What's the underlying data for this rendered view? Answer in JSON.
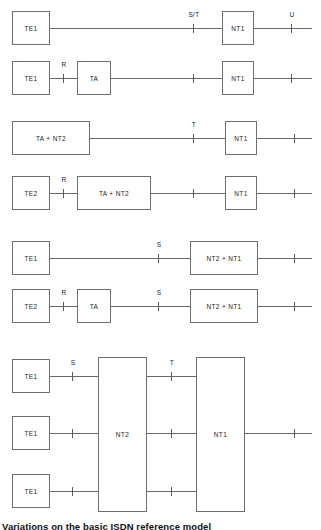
{
  "figure": {
    "caption": "Variations on the basic ISDN reference model",
    "colors": {
      "box_border": "#6e6e6e",
      "wire": "#6a6a6a",
      "tick": "#5a5a5a",
      "text": "#1d1d1d",
      "background": "#ffffff"
    }
  },
  "rows": [
    {
      "id": "row-1",
      "boxes": [
        {
          "label": "TE1"
        },
        {
          "label": "NT1"
        }
      ],
      "interfaces": [
        {
          "label": "S/T"
        },
        {
          "label": "U"
        }
      ]
    },
    {
      "id": "row-2",
      "boxes": [
        {
          "label": "TE1"
        },
        {
          "label": "TA"
        },
        {
          "label": "NT1"
        }
      ],
      "interfaces": [
        {
          "label": "R"
        },
        {
          "label": ""
        },
        {
          "label": ""
        }
      ]
    },
    {
      "id": "row-3",
      "boxes": [
        {
          "label": "TA + NT2"
        },
        {
          "label": "NT1"
        }
      ],
      "interfaces": [
        {
          "label": "T"
        },
        {
          "label": ""
        }
      ]
    },
    {
      "id": "row-4",
      "boxes": [
        {
          "label": "TE2"
        },
        {
          "label": "TA + NT2"
        },
        {
          "label": "NT1"
        }
      ],
      "interfaces": [
        {
          "label": "R"
        },
        {
          "label": ""
        },
        {
          "label": ""
        }
      ]
    },
    {
      "id": "row-5",
      "boxes": [
        {
          "label": "TE1"
        },
        {
          "label": "NT2 + NT1"
        }
      ],
      "interfaces": [
        {
          "label": "S"
        },
        {
          "label": ""
        }
      ]
    },
    {
      "id": "row-6",
      "boxes": [
        {
          "label": "TE2"
        },
        {
          "label": "TA"
        },
        {
          "label": "NT2 + NT1"
        }
      ],
      "interfaces": [
        {
          "label": "R"
        },
        {
          "label": "S"
        },
        {
          "label": ""
        }
      ]
    },
    {
      "id": "row-7",
      "boxes": [
        {
          "label": "TE1"
        },
        {
          "label": "TE1"
        },
        {
          "label": "TE1"
        },
        {
          "label": "NT2"
        },
        {
          "label": "NT1"
        }
      ],
      "interfaces": [
        {
          "label": "S"
        },
        {
          "label": "T"
        },
        {
          "label": ""
        }
      ]
    }
  ]
}
